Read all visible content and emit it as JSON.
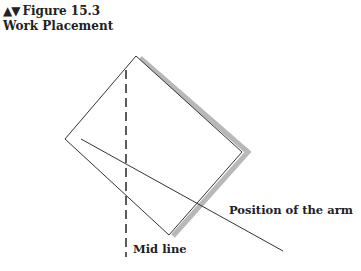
{
  "figure": {
    "nav_arrows": "▲▼",
    "number": "Figure 15.3",
    "title": "Work Placement"
  },
  "diagram": {
    "labels": {
      "arm": "Position of the arm",
      "midline": "Mid line"
    },
    "colors": {
      "stroke": "#333333",
      "shadow": "#b8b8b8",
      "text": "#222222"
    }
  }
}
